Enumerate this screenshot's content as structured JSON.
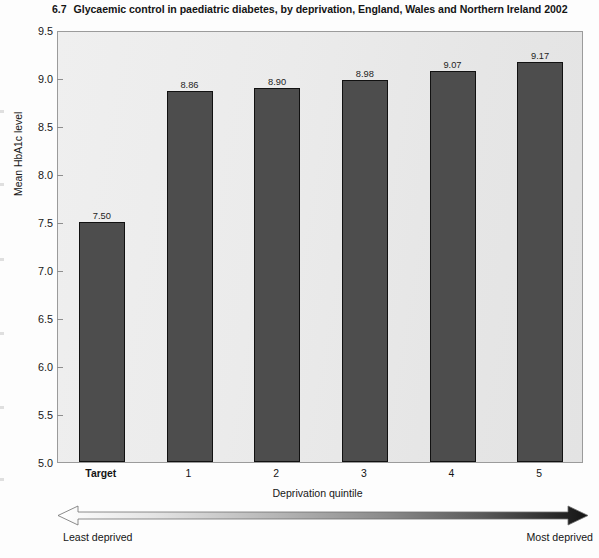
{
  "chart_data": {
    "type": "bar",
    "title_number": "6.7",
    "title_text": "Glycaemic control in paediatric diabetes, by deprivation, England, Wales and Northern Ireland 2002",
    "categories": [
      "Target",
      "1",
      "2",
      "3",
      "4",
      "5"
    ],
    "values": [
      7.5,
      8.86,
      8.9,
      8.98,
      9.07,
      9.17
    ],
    "value_labels": [
      "7.50",
      "8.86",
      "8.90",
      "8.98",
      "9.07",
      "9.17"
    ],
    "xlabel": "Deprivation quintile",
    "ylabel": "Mean HbA1c level",
    "ylim": [
      5.0,
      9.5
    ],
    "ytick_labels": [
      "9.5",
      "9.0",
      "8.5",
      "8.0",
      "7.5",
      "7.0",
      "6.5",
      "6.0",
      "5.5",
      "5.0"
    ],
    "ytick_values": [
      9.5,
      9.0,
      8.5,
      8.0,
      7.5,
      7.0,
      6.5,
      6.0,
      5.5,
      5.0
    ],
    "grid": false,
    "legend": "none",
    "bar_color": "#4d4d4d",
    "bar_border_color": "#111111",
    "plot_background": "#eaeaea",
    "annotation": {
      "type": "double-headed-gradient-arrow",
      "left_label": "Least deprived",
      "right_label": "Most deprived",
      "gradient_from": "#ffffff",
      "gradient_to": "#1a1a1a"
    }
  }
}
